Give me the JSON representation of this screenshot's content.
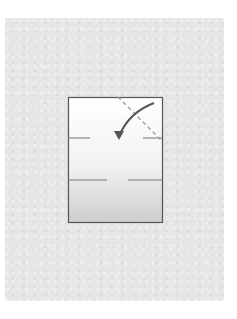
{
  "diagram": {
    "type": "origami-fold-step",
    "background_color": "#e6e6e6",
    "paper": {
      "x": 68,
      "y": 97,
      "width": 94,
      "height": 125,
      "gradient_top": "#ffffff",
      "gradient_bottom": "#cfcfcf",
      "border_color": "#555555"
    },
    "crease_marks": [
      {
        "name": "upper-left-crease",
        "x1": 68,
        "y1": 138,
        "x2": 90,
        "y2": 138
      },
      {
        "name": "upper-right-crease",
        "x1": 143,
        "y1": 138,
        "x2": 162,
        "y2": 138
      },
      {
        "name": "middle-left-crease",
        "x1": 68,
        "y1": 180,
        "x2": 107,
        "y2": 180
      },
      {
        "name": "middle-right-crease",
        "x1": 128,
        "y1": 180,
        "x2": 162,
        "y2": 180
      }
    ],
    "valley_fold_line": {
      "x1": 118,
      "y1": 97,
      "x2": 162,
      "y2": 141,
      "style": "dashed"
    },
    "fold_arrow": {
      "from": [
        153,
        103
      ],
      "to": [
        118,
        137
      ],
      "color": "#555555",
      "direction": "fold corner down-left"
    }
  }
}
